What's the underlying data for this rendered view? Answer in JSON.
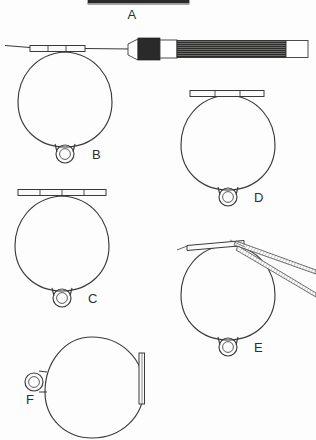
{
  "figure": {
    "background_color": "#fdfdfd",
    "ink_color": "#3a3a3a",
    "label_color": "#2e2e2e",
    "caption": "",
    "caption_visible": false
  },
  "items": [
    {
      "id": "A",
      "label": "A",
      "kind": "scale-bar",
      "description": "solid dark horizontal bar, cropped at top edge",
      "color": "#2a2a2a"
    },
    {
      "id": "B",
      "label": "B",
      "kind": "ring-loop-with-handle",
      "description": "circular loop with eyelet and segmented top bar, mounted on knurled handle",
      "bar_segments": 3,
      "has_handle": true,
      "has_forceps": false
    },
    {
      "id": "C",
      "label": "C",
      "kind": "ring-loop",
      "description": "circular loop with eyelet and wide segmented top bar overhanging the rim",
      "bar_segments": 4,
      "has_handle": false,
      "has_forceps": false
    },
    {
      "id": "D",
      "label": "D",
      "kind": "ring-loop",
      "description": "circular loop with eyelet and segmented top bar",
      "bar_segments": 3,
      "has_handle": false,
      "has_forceps": false
    },
    {
      "id": "E",
      "label": "E",
      "kind": "ring-loop-with-forceps",
      "description": "circular loop with eyelet and plain top bar gripped by angled forceps",
      "bar_segments": 1,
      "has_handle": false,
      "has_forceps": true
    },
    {
      "id": "F",
      "label": "F",
      "kind": "ring-loop-rotated",
      "description": "circular loop rotated ninety degrees, eyelet at left, bar vertical at right",
      "bar_segments": 1,
      "has_handle": false,
      "has_forceps": false
    }
  ],
  "handle": {
    "ferrule_color": "#2a2a2a",
    "body_texture": "striated",
    "end_cap_color": "#ffffff"
  }
}
